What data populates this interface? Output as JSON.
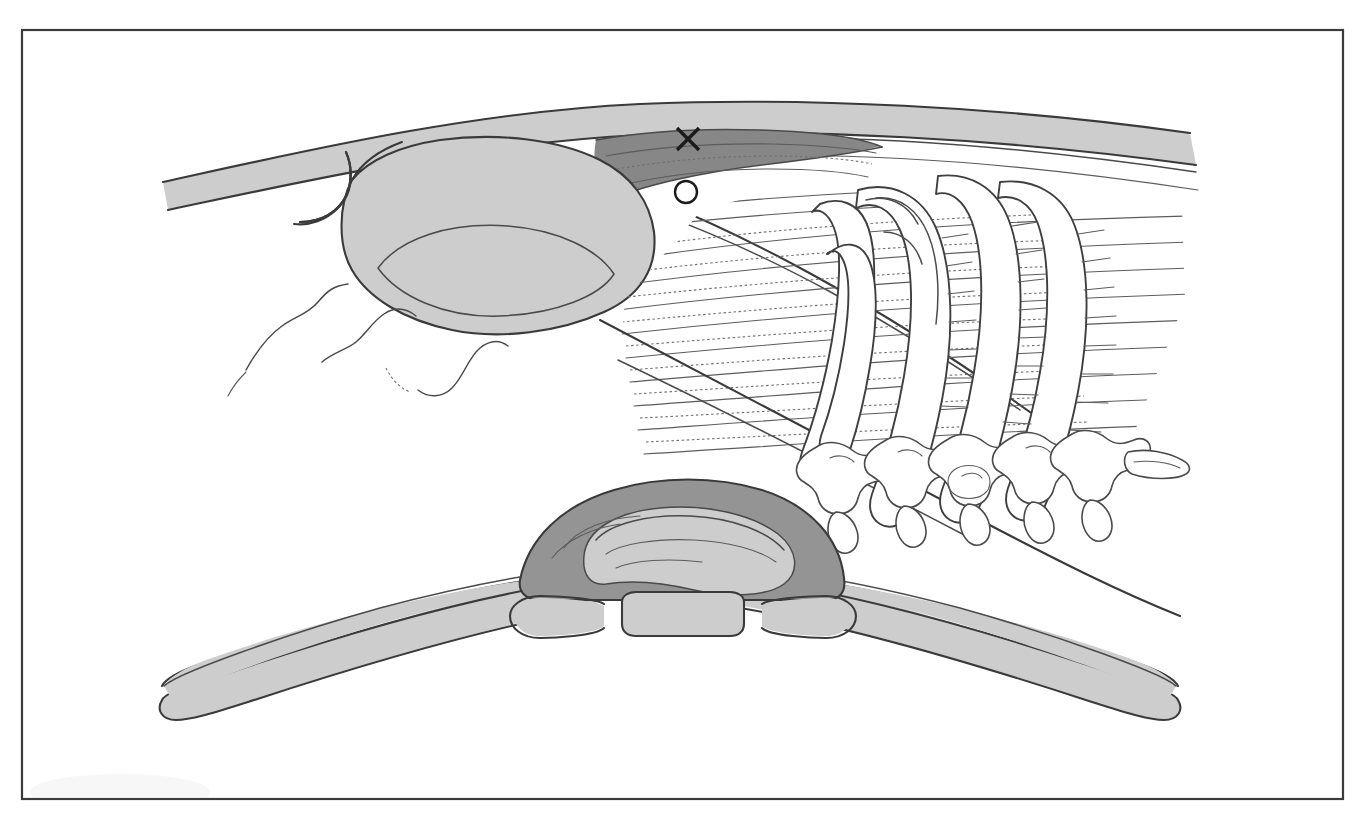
{
  "figure": {
    "caption_artifact": "",
    "frame": {
      "stroke_color": "#3b3b3b",
      "x": 22,
      "y": 30,
      "width": 1321,
      "height": 769
    },
    "palette": {
      "background": "#ffffff",
      "outline": "#3a3a3a",
      "fill_light_gray": "#cdcdcd",
      "fill_mid_gray": "#b0b0b0",
      "fill_dark_gray": "#949494",
      "fill_darker_gray": "#878787",
      "marker_black": "#1b1b1b"
    },
    "markers": [
      {
        "name": "lesion-x-marker",
        "symbol": "X",
        "description": "X mark indicating target site",
        "x": 688,
        "y": 139,
        "size": 22
      },
      {
        "name": "landmark-circle-marker",
        "symbol": "O",
        "description": "Open white circle landmark",
        "x": 686,
        "y": 192,
        "radius": 11
      }
    ],
    "regions": [
      {
        "name": "upper-soft-tissue-mass",
        "label": "Upper shaded soft-tissue mass",
        "tone": "light"
      },
      {
        "name": "skin-fascia-band",
        "label": "Skin and superficial fascia band",
        "tone": "light"
      },
      {
        "name": "dark-wedge-plane",
        "label": "Dark wedge tissue plane beneath X",
        "tone": "darker"
      },
      {
        "name": "muscle-striation-fan",
        "label": "Fan of muscle fiber striations",
        "tone": "none"
      },
      {
        "name": "rib-cage-group",
        "label": "Rib arches",
        "count": 4
      },
      {
        "name": "vertebrae-group",
        "label": "Thoracic vertebrae",
        "count": 5
      },
      {
        "name": "wavy-fascia-lines",
        "label": "Wavy fascia / adipose contour lines",
        "count": 4
      },
      {
        "name": "lower-clavicle-assembly",
        "label": "Lower clavicle and manubrium assembly",
        "tone": "light"
      },
      {
        "name": "manubrium-body",
        "label": "Manubrium central shaded body",
        "tone": "dark"
      },
      {
        "name": "sternal-notch-segment",
        "label": "Central sternal notch segment",
        "tone": "light"
      }
    ]
  },
  "chart_data": {
    "type": "diagram",
    "elements": [
      "skin-fascia-band",
      "upper-soft-tissue-mass",
      "dark-wedge-plane",
      "lesion-x-marker",
      "landmark-circle-marker",
      "muscle-striation-fan",
      "rib-arch-1",
      "rib-arch-2",
      "rib-arch-3",
      "rib-arch-4",
      "vertebra-1",
      "vertebra-2",
      "vertebra-3",
      "vertebra-4",
      "vertebra-5",
      "left-clavicle",
      "right-clavicle",
      "manubrium",
      "sternal-notch-segment"
    ]
  }
}
